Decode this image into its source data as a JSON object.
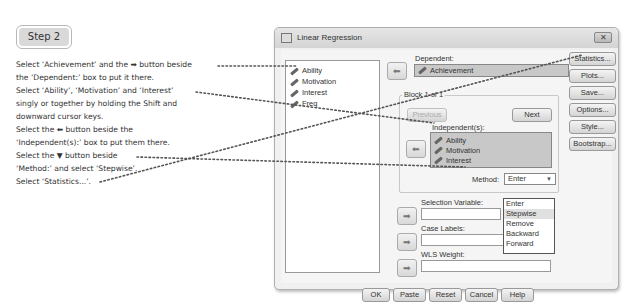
{
  "step": {
    "label": "Step 2"
  },
  "instructions": [
    "Select ‘Achievement’ and the ➡ button beside",
    "the ‘Dependent:’ box to put it there.",
    "Select ‘Ability’, ‘Motivation’ and ‘Interest’",
    "singly or together by holding the Shift and",
    "downward cursor keys.",
    "Select the ⬅ button beside the",
    "‘Independent(s):’ box to put them there.",
    "Select the ▼ button beside",
    "‘Method:’ and select ‘Stepwise’.",
    "Select ‘Statistics...’."
  ],
  "dialog": {
    "title": "Linear Regression",
    "close_icon": "✕",
    "variables": [
      "Ability",
      "Motivation",
      "Interest",
      "Freq"
    ],
    "dependent": {
      "label": "Dependent:",
      "value": "Achievement"
    },
    "block": {
      "label": "Block 1 of 1",
      "previous": "Previous",
      "next": "Next",
      "independents_label": "Independent(s):",
      "independents": [
        "Ability",
        "Motivation",
        "Interest"
      ],
      "method_label": "Method:",
      "method_value": "Enter",
      "method_caret": "▼"
    },
    "method_options": [
      "Enter",
      "Stepwise",
      "Remove",
      "Backward",
      "Forward"
    ],
    "method_highlighted": "Stepwise",
    "selection_variable_label": "Selection Variable:",
    "case_labels_label": "Case Labels:",
    "wls_weight_label": "WLS Weight:",
    "side_buttons": [
      "Statistics...",
      "Plots...",
      "Save...",
      "Options...",
      "Style...",
      "Bootstrap..."
    ],
    "bottom_buttons": [
      "OK",
      "Paste",
      "Reset",
      "Cancel",
      "Help"
    ],
    "arrow_right": "➡",
    "arrow_left": "⬅"
  }
}
